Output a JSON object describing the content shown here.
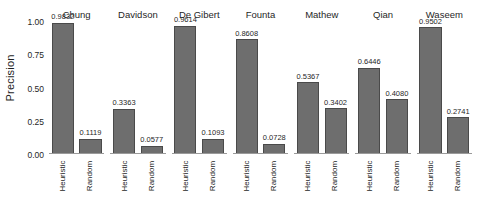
{
  "chart_data": {
    "type": "bar",
    "title": "",
    "subtitle": "",
    "xlabel": "",
    "ylabel": "Precision",
    "ylim": [
      0,
      1.0
    ],
    "grid": false,
    "legend": "none",
    "facet_variable": "dataset",
    "categories": [
      "Heuristic",
      "Random"
    ],
    "y_ticks": [
      {
        "value": 1.0,
        "label": "1.00"
      },
      {
        "value": 0.75,
        "label": "0.75"
      },
      {
        "value": 0.5,
        "label": "0.50"
      },
      {
        "value": 0.25,
        "label": "0.25"
      },
      {
        "value": 0.0,
        "label": "0.00"
      }
    ],
    "panels": [
      {
        "title": "Chung",
        "bars": [
          {
            "category": "Heuristic",
            "value": 0.9832,
            "label": "0.9832"
          },
          {
            "category": "Random",
            "value": 0.1119,
            "label": "0.1119"
          }
        ]
      },
      {
        "title": "Davidson",
        "bars": [
          {
            "category": "Heuristic",
            "value": 0.3363,
            "label": "0.3363"
          },
          {
            "category": "Random",
            "value": 0.0577,
            "label": "0.0577"
          }
        ]
      },
      {
        "title": "De Gibert",
        "bars": [
          {
            "category": "Heuristic",
            "value": 0.9614,
            "label": "0.9614"
          },
          {
            "category": "Random",
            "value": 0.1093,
            "label": "0.1093"
          }
        ]
      },
      {
        "title": "Founta",
        "bars": [
          {
            "category": "Heuristic",
            "value": 0.8608,
            "label": "0.8608"
          },
          {
            "category": "Random",
            "value": 0.0728,
            "label": "0.0728"
          }
        ]
      },
      {
        "title": "Mathew",
        "bars": [
          {
            "category": "Heuristic",
            "value": 0.5367,
            "label": "0.5367"
          },
          {
            "category": "Random",
            "value": 0.3402,
            "label": "0.3402"
          }
        ]
      },
      {
        "title": "Qian",
        "bars": [
          {
            "category": "Heuristic",
            "value": 0.6446,
            "label": "0.6446"
          },
          {
            "category": "Random",
            "value": 0.408,
            "label": "0.4080"
          }
        ]
      },
      {
        "title": "Waseem",
        "bars": [
          {
            "category": "Heuristic",
            "value": 0.9502,
            "label": "0.9502"
          },
          {
            "category": "Random",
            "value": 0.2741,
            "label": "0.2741"
          }
        ]
      }
    ],
    "colors": {
      "bar_fill": "#6e6e6e",
      "bar_border": "#4a4a4a",
      "axis_line": "#9a9a9a",
      "text": "#1f1f1f",
      "background": "#ffffff"
    }
  }
}
